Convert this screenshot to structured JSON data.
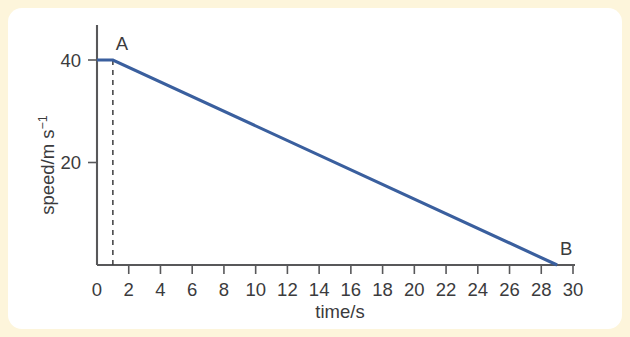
{
  "figure": {
    "background_color": "#fdf5db",
    "card_color": "#ffffff",
    "axis_color": "#58585a",
    "text_color": "#3b3b3d"
  },
  "chart_data": {
    "type": "line",
    "title": "",
    "xlabel": "time/s",
    "ylabel_parts": {
      "main": "speed/m s",
      "exponent": "−1"
    },
    "ylabel": "speed/m s⁻¹",
    "xlim": [
      0,
      30
    ],
    "ylim": [
      0,
      44
    ],
    "xticks": [
      0,
      2,
      4,
      6,
      8,
      10,
      12,
      14,
      16,
      18,
      20,
      22,
      24,
      26,
      28,
      30
    ],
    "xticklabels": [
      "0",
      "2",
      "4",
      "6",
      "8",
      "10",
      "12",
      "14",
      "16",
      "18",
      "20",
      "22",
      "24",
      "26",
      "28",
      "30"
    ],
    "yticks": [
      20,
      40
    ],
    "yticklabels": [
      "20",
      "40"
    ],
    "grid": false,
    "legend": "none",
    "series": [
      {
        "name": "speed",
        "color": "#3a5f9e",
        "x": [
          0,
          1,
          29
        ],
        "y": [
          40,
          40,
          0
        ]
      }
    ],
    "annotations": [
      {
        "label": "A",
        "x": 1,
        "y": 40,
        "note": "start of deceleration"
      },
      {
        "label": "B",
        "x": 29,
        "y": 0,
        "note": "vehicle at rest"
      }
    ],
    "guides": [
      {
        "type": "vertical-dashed",
        "x": 1,
        "y_from": 0,
        "y_to": 40
      }
    ]
  }
}
